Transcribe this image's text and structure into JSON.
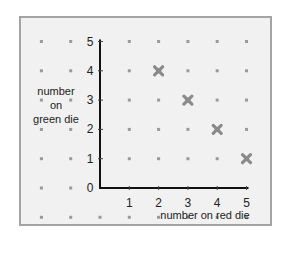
{
  "chart_data": {
    "type": "scatter",
    "title": "",
    "xlabel": "number on red die",
    "ylabel": "number on green die",
    "ylabel_lines": [
      "number",
      "on",
      "green die"
    ],
    "x_ticks": [
      1,
      2,
      3,
      4,
      5
    ],
    "y_ticks": [
      0,
      1,
      2,
      3,
      4,
      5
    ],
    "xlim": [
      0,
      5
    ],
    "ylim": [
      0,
      5
    ],
    "grid": "dot-grid",
    "legend": null,
    "series": [
      {
        "name": "points",
        "marker": "x",
        "color": "#8a8a8a",
        "points": [
          {
            "x": 2,
            "y": 4
          },
          {
            "x": 3,
            "y": 3
          },
          {
            "x": 4,
            "y": 2
          },
          {
            "x": 5,
            "y": 1
          }
        ]
      }
    ]
  },
  "style": {
    "frame_bg": "#f1f1f1",
    "frame_border": "#a4a4a4",
    "axis_color": "#111111",
    "dot_color": "#9a9a9a",
    "marker_color": "#8a8a8a"
  }
}
